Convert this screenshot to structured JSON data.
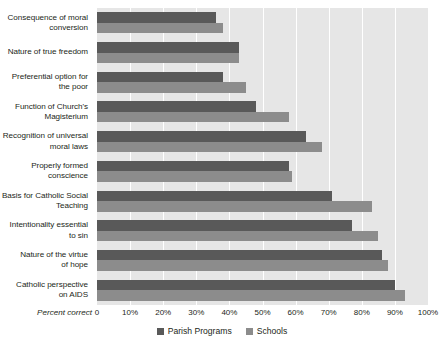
{
  "chart_data": {
    "type": "bar",
    "orientation": "horizontal",
    "title": "",
    "xlabel": "Percent correct",
    "ylabel": "",
    "xlim": [
      0,
      100
    ],
    "xticks": [
      0,
      10,
      20,
      30,
      40,
      50,
      60,
      70,
      80,
      90,
      100
    ],
    "xtick_labels": [
      "0",
      "10%",
      "20%",
      "30%",
      "40%",
      "50%",
      "60%",
      "70%",
      "80%",
      "90%",
      "100%"
    ],
    "grid": true,
    "legend_position": "bottom-center",
    "categories": [
      "Consequence of moral\nconversion",
      "Nature of true freedom",
      "Preferential option for\nthe poor",
      "Function of Church's\nMagisterium",
      "Recognition of universal\nmoral laws",
      "Properly formed\nconscience",
      "Basis for Catholic Social\nTeaching",
      "Intentionality essential\nto sin",
      "Nature of the virtue\nof hope",
      "Catholic perspective\non AIDS"
    ],
    "series": [
      {
        "name": "Parish Programs",
        "color": "#595959",
        "values": [
          36,
          43,
          38,
          48,
          63,
          58,
          71,
          77,
          86,
          90
        ]
      },
      {
        "name": "Schools",
        "color": "#8c8c8c",
        "values": [
          38,
          43,
          45,
          58,
          68,
          59,
          83,
          85,
          88,
          93
        ]
      }
    ]
  },
  "colors": {
    "plot_background": "#e6e6e6",
    "gridline": "#ffffff",
    "text": "#231f20",
    "parish": "#595959",
    "schools": "#8c8c8c"
  }
}
